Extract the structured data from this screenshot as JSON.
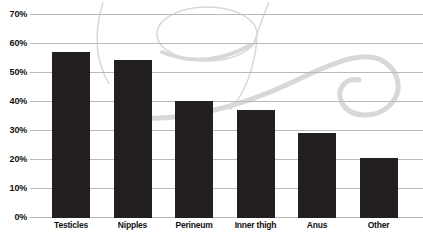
{
  "page": {
    "background": "#ffffff"
  },
  "colors": {
    "bar": "#231f20",
    "gridline": "#b9b9b9",
    "text": "#111111",
    "flourish": "#d8d8d8"
  },
  "chart_data": {
    "type": "bar",
    "title": "",
    "xlabel": "",
    "ylabel": "",
    "categories": [
      "Testicles",
      "Nipples",
      "Perineum",
      "Inner thigh",
      "Anus",
      "Other"
    ],
    "values": [
      57,
      54,
      40,
      37,
      29,
      20.5
    ],
    "unit": "%",
    "y_axis": {
      "min": 0,
      "max": 70,
      "tick_step": 10,
      "tick_labels": [
        "0%",
        "10%",
        "20%",
        "30%",
        "40%",
        "50%",
        "60%",
        "70%"
      ]
    },
    "grid": "horizontal",
    "legend": "none",
    "background_decoration": "calligraphic-swirl-flourish"
  }
}
